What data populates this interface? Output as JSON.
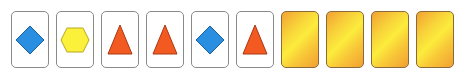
{
  "board": {
    "cards": [
      {
        "state": "face-up",
        "shape": "diamond",
        "color": "#2a8fe0"
      },
      {
        "state": "face-up",
        "shape": "hexagon",
        "color": "#fbf03a"
      },
      {
        "state": "face-up",
        "shape": "triangle",
        "color": "#f25a22"
      },
      {
        "state": "face-up",
        "shape": "triangle",
        "color": "#f25a22"
      },
      {
        "state": "face-up",
        "shape": "diamond",
        "color": "#2a8fe0"
      },
      {
        "state": "face-up",
        "shape": "triangle",
        "color": "#f25a22"
      },
      {
        "state": "face-down"
      },
      {
        "state": "face-down"
      },
      {
        "state": "face-down"
      },
      {
        "state": "face-down"
      }
    ]
  }
}
